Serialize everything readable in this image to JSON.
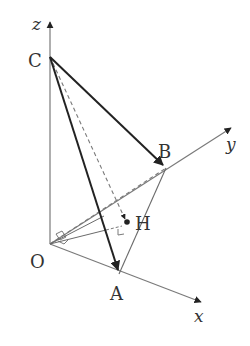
{
  "diagram": {
    "type": "3d-coordinate-tetrahedron",
    "colors": {
      "background": "#ffffff",
      "axis": "#7a7a7a",
      "solid_edge": "#222222",
      "thin_edge": "#6a6a6a",
      "dashed_edge": "#7a7a7a",
      "label": "#333333"
    },
    "axes": [
      {
        "name": "z",
        "label": "z"
      },
      {
        "name": "y",
        "label": "y"
      },
      {
        "name": "x",
        "label": "x"
      }
    ],
    "points": {
      "O": {
        "label": "O"
      },
      "A": {
        "label": "A"
      },
      "B": {
        "label": "B"
      },
      "C": {
        "label": "C"
      },
      "H": {
        "label": "H"
      }
    },
    "edges": [
      {
        "from": "C",
        "to": "A",
        "style": "bold-arrow"
      },
      {
        "from": "C",
        "to": "B",
        "style": "bold-arrow"
      },
      {
        "from": "C",
        "to": "H",
        "style": "dashed-arrow"
      },
      {
        "from": "B",
        "to": "A",
        "style": "thin"
      },
      {
        "from": "O",
        "to": "A",
        "style": "axis"
      },
      {
        "from": "O",
        "to": "B",
        "style": "dashed"
      },
      {
        "from": "O",
        "to": "C",
        "style": "axis"
      },
      {
        "from": "O",
        "to": "H",
        "style": "thin"
      }
    ],
    "annotations": [
      {
        "type": "right-angle",
        "at": "O"
      },
      {
        "type": "right-angle",
        "at": "H"
      }
    ]
  }
}
